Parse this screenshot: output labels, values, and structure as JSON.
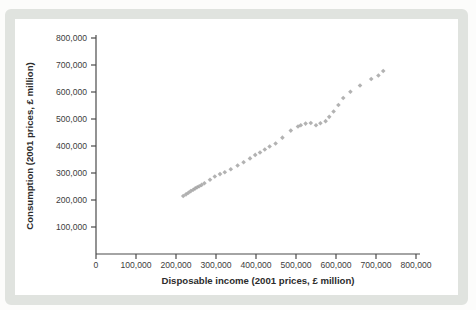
{
  "figure": {
    "page_background": "#fcfcfb",
    "frame_color": "#e0e3df",
    "panel_color": "#ffffff",
    "axis_color": "#4a4a4a",
    "tick_text_color": "#3d3d3d",
    "marker_color": "#9f9f9f"
  },
  "chart_data": {
    "type": "scatter",
    "title": "",
    "xlabel": "Disposable income (2001 prices, £ million)",
    "ylabel": "Consumption (2001 prices, £ million)",
    "xlim": [
      0,
      800000
    ],
    "ylim": [
      0,
      800000
    ],
    "grid": false,
    "legend": null,
    "marker": {
      "shape": "diamond",
      "size": 4,
      "color": "#9f9f9f"
    },
    "x_ticks": [
      0,
      100000,
      200000,
      300000,
      400000,
      500000,
      600000,
      700000,
      800000
    ],
    "x_tick_labels": [
      "0",
      "100,000",
      "200,000",
      "300,000",
      "400,000",
      "500,000",
      "600,000",
      "700,000",
      "800,000"
    ],
    "y_ticks": [
      100000,
      200000,
      300000,
      400000,
      500000,
      600000,
      700000,
      800000
    ],
    "y_tick_labels": [
      "100,000",
      "200,000",
      "300,000",
      "400,000",
      "500,000",
      "600,000",
      "700,000",
      "800,000"
    ],
    "points": [
      [
        218000,
        215000
      ],
      [
        225000,
        221000
      ],
      [
        231000,
        227000
      ],
      [
        237000,
        233000
      ],
      [
        243000,
        238000
      ],
      [
        248000,
        243000
      ],
      [
        253000,
        247000
      ],
      [
        258000,
        251000
      ],
      [
        264000,
        256000
      ],
      [
        271000,
        262000
      ],
      [
        285000,
        275000
      ],
      [
        297000,
        287000
      ],
      [
        310000,
        296000
      ],
      [
        322000,
        303000
      ],
      [
        337000,
        314000
      ],
      [
        354000,
        328000
      ],
      [
        369000,
        340000
      ],
      [
        385000,
        354000
      ],
      [
        398000,
        367000
      ],
      [
        410000,
        376000
      ],
      [
        422000,
        387000
      ],
      [
        434000,
        398000
      ],
      [
        449000,
        409000
      ],
      [
        466000,
        431000
      ],
      [
        487000,
        457000
      ],
      [
        505000,
        472000
      ],
      [
        512000,
        477000
      ],
      [
        524000,
        483000
      ],
      [
        537000,
        485000
      ],
      [
        550000,
        477000
      ],
      [
        561000,
        484000
      ],
      [
        574000,
        492000
      ],
      [
        583000,
        508000
      ],
      [
        594000,
        528000
      ],
      [
        606000,
        552000
      ],
      [
        618000,
        578000
      ],
      [
        636000,
        601000
      ],
      [
        660000,
        624000
      ],
      [
        688000,
        648000
      ],
      [
        706000,
        661000
      ],
      [
        718000,
        678000
      ]
    ]
  }
}
